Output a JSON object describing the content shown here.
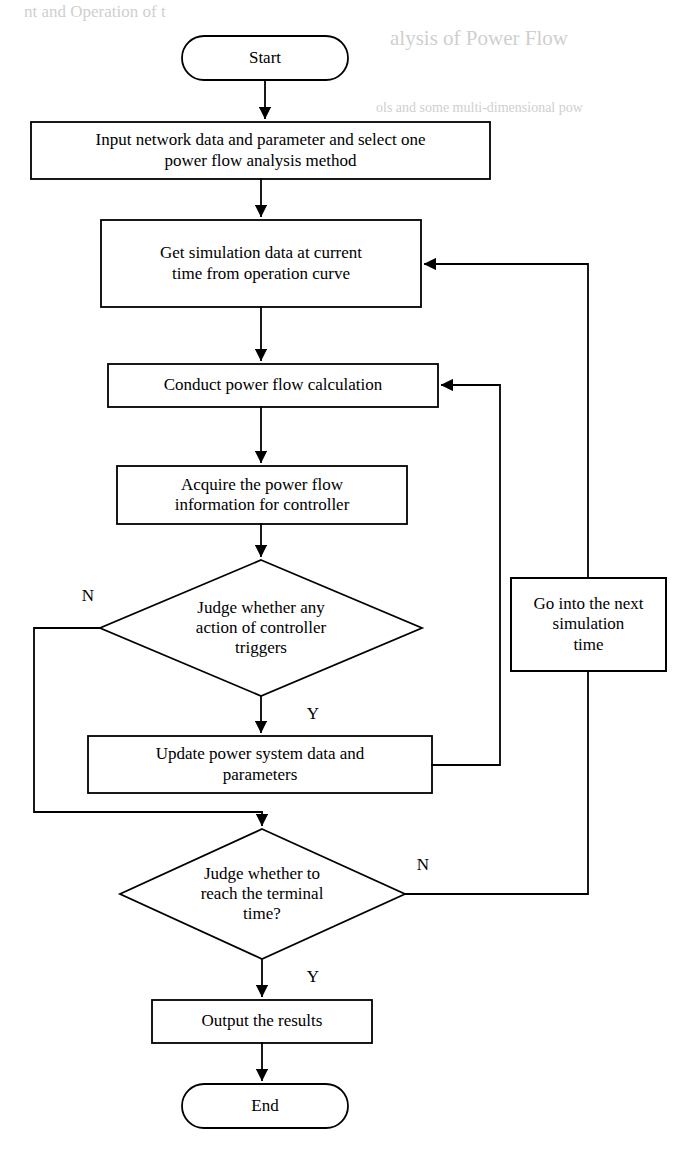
{
  "page": {
    "width": 696,
    "height": 1156,
    "background": "#ffffff",
    "ink": "#000000",
    "ghost_ink": "#cfcfcf"
  },
  "ghost_text": {
    "top_left": "nt and Operation of  t",
    "top_right": "alysis of Power Flow",
    "second_right": "ols and some multi-dimensional pow"
  },
  "diagram": {
    "type": "flowchart",
    "nodes": [
      {
        "id": "start",
        "shape": "terminator",
        "label": "Start",
        "x": 182,
        "y": 36,
        "w": 166,
        "h": 44
      },
      {
        "id": "input-data",
        "shape": "process",
        "label": "Input network data and parameter and select one\npower flow analysis method",
        "x": 31,
        "y": 122,
        "w": 459,
        "h": 57
      },
      {
        "id": "get-simulation-data",
        "shape": "process",
        "label": "Get simulation data at current\ntime from operation curve",
        "x": 101,
        "y": 220,
        "w": 320,
        "h": 87
      },
      {
        "id": "conduct-power-flow",
        "shape": "process",
        "label": "Conduct power flow calculation",
        "x": 108,
        "y": 364,
        "w": 330,
        "h": 43
      },
      {
        "id": "acquire-power-flow-info",
        "shape": "process",
        "label": "Acquire the power flow\ninformation for controller",
        "x": 117,
        "y": 466,
        "w": 290,
        "h": 58
      },
      {
        "id": "judge-controller-action",
        "shape": "decision",
        "label": "Judge whether any\naction of controller\ntriggers",
        "x": 100,
        "y": 560,
        "w": 322,
        "h": 136
      },
      {
        "id": "go-next-simulation-time",
        "shape": "process",
        "label": "Go into the next\nsimulation\ntime",
        "x": 511,
        "y": 578,
        "w": 155,
        "h": 93
      },
      {
        "id": "update-power-system",
        "shape": "process",
        "label": "Update power system data and\nparameters",
        "x": 88,
        "y": 736,
        "w": 344,
        "h": 57
      },
      {
        "id": "judge-terminal-time",
        "shape": "decision",
        "label": "Judge whether to\nreach the terminal\ntime?",
        "x": 120,
        "y": 829,
        "w": 285,
        "h": 130
      },
      {
        "id": "output-results",
        "shape": "process",
        "label": "Output the results",
        "x": 152,
        "y": 1000,
        "w": 220,
        "h": 43
      },
      {
        "id": "end",
        "shape": "terminator",
        "label": "End",
        "x": 182,
        "y": 1084,
        "w": 166,
        "h": 44
      }
    ],
    "edge_labels": [
      {
        "id": "controller-no",
        "text": "N",
        "x": 80,
        "y": 586
      },
      {
        "id": "controller-yes",
        "text": "Y",
        "x": 305,
        "y": 704
      },
      {
        "id": "terminal-no",
        "text": "N",
        "x": 415,
        "y": 855
      },
      {
        "id": "terminal-yes",
        "text": "Y",
        "x": 305,
        "y": 967
      }
    ],
    "edges": [
      {
        "id": "start-to-input",
        "from": "start",
        "to": "input-data",
        "label": ""
      },
      {
        "id": "input-to-get-data",
        "from": "input-data",
        "to": "get-simulation-data",
        "label": ""
      },
      {
        "id": "get-data-to-conduct",
        "from": "get-simulation-data",
        "to": "conduct-power-flow",
        "label": ""
      },
      {
        "id": "conduct-to-acquire",
        "from": "conduct-power-flow",
        "to": "acquire-power-flow-info",
        "label": ""
      },
      {
        "id": "acquire-to-judge-controller",
        "from": "acquire-power-flow-info",
        "to": "judge-controller-action",
        "label": ""
      },
      {
        "id": "judge-controller-yes-to-update",
        "from": "judge-controller-action",
        "to": "update-power-system",
        "label": "Y"
      },
      {
        "id": "judge-controller-no-to-judge-terminal",
        "from": "judge-controller-action",
        "to": "judge-terminal-time",
        "label": "N"
      },
      {
        "id": "update-to-conduct-loop",
        "from": "update-power-system",
        "to": "conduct-power-flow",
        "label": ""
      },
      {
        "id": "judge-terminal-no-to-next-time",
        "from": "judge-terminal-time",
        "to": "go-next-simulation-time",
        "label": "N"
      },
      {
        "id": "next-time-to-get-data",
        "from": "go-next-simulation-time",
        "to": "get-simulation-data",
        "label": ""
      },
      {
        "id": "judge-terminal-yes-to-output",
        "from": "judge-terminal-time",
        "to": "output-results",
        "label": "Y"
      },
      {
        "id": "output-to-end",
        "from": "output-results",
        "to": "end",
        "label": ""
      }
    ]
  }
}
